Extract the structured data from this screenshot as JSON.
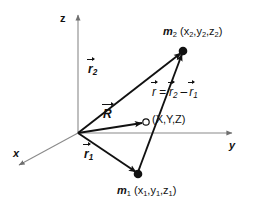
{
  "figure": {
    "type": "vector-diagram",
    "background_color": "#ffffff",
    "axis_color": "#8a8a8a",
    "vector_color": "#111111"
  },
  "axes": [
    {
      "name": "z-axis",
      "label": "z",
      "direction": "up",
      "origin": [
        78,
        133
      ],
      "tip": [
        78,
        14
      ]
    },
    {
      "name": "y-axis",
      "label": "y",
      "direction": "right",
      "origin": [
        78,
        133
      ],
      "tip": [
        233,
        133
      ]
    },
    {
      "name": "x-axis",
      "label": "x",
      "direction": "down-left",
      "origin": [
        78,
        133
      ],
      "tip": [
        18,
        166
      ]
    }
  ],
  "origin": {
    "name": "origin",
    "x": 78,
    "y": 133
  },
  "points": [
    {
      "name": "mass-2",
      "marker": "filled-circle",
      "x": 183,
      "y": 51,
      "symbol": "m",
      "subscript": "2",
      "coords": "(x2,y2,z2)",
      "coord_parts": [
        "x",
        "2",
        "y",
        "2",
        "z",
        "2"
      ],
      "label_x": 163,
      "label_y": 28
    },
    {
      "name": "mass-1",
      "marker": "filled-circle",
      "x": 138,
      "y": 174,
      "symbol": "m",
      "subscript": "1",
      "coords": "(x1,y1,z1)",
      "coord_parts": [
        "x",
        "1",
        "y",
        "1",
        "z",
        "1"
      ],
      "label_x": 117,
      "label_y": 186
    },
    {
      "name": "field-point",
      "marker": "open-circle",
      "x": 146,
      "y": 122,
      "symbol": "",
      "coords": "(X,Y,Z)",
      "label_x": 153,
      "label_y": 115
    }
  ],
  "vectors": [
    {
      "name": "vector-r2",
      "glyph": "r",
      "subscript": "2",
      "from": [
        78,
        133
      ],
      "to": [
        183,
        51
      ],
      "label_x": 88,
      "label_y": 65
    },
    {
      "name": "vector-r1",
      "glyph": "r",
      "subscript": "1",
      "from": [
        78,
        133
      ],
      "to": [
        138,
        174
      ],
      "label_x": 84,
      "label_y": 150
    },
    {
      "name": "vector-R",
      "glyph": "R",
      "subscript": "",
      "from": [
        78,
        133
      ],
      "to": [
        144,
        122
      ],
      "label_x": 104,
      "label_y": 110
    },
    {
      "name": "vector-r",
      "glyph": "r",
      "subscript": "",
      "from": [
        138,
        174
      ],
      "to": [
        183,
        51
      ],
      "label_x": 0,
      "label_y": 0
    }
  ],
  "equation": {
    "name": "vector-equation",
    "text": "r = r2 - r1",
    "lhs": "r",
    "equals": "=",
    "term1": "r",
    "term1_sub": "2",
    "minus": "–",
    "term2": "r",
    "term2_sub": "1",
    "x": 152,
    "y": 88
  },
  "axis_labels": {
    "z": "z",
    "y": "y",
    "x": "x"
  }
}
